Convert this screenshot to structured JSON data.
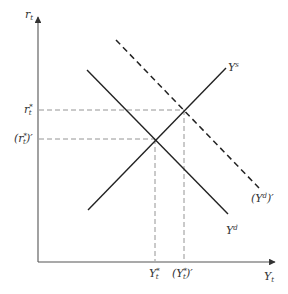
{
  "diagram": {
    "type": "supply-demand shift diagram",
    "axes": {
      "y_axis_label": {
        "base": "r",
        "sub": "t"
      },
      "x_axis_label": {
        "base": "Y",
        "sub": "t"
      },
      "origin": [
        38,
        262
      ],
      "y_axis_top": [
        38,
        17
      ],
      "x_axis_right": [
        275,
        262
      ]
    },
    "curves": [
      {
        "id": "Ys",
        "label": {
          "base": "Y",
          "sup": "s"
        },
        "style": "solid",
        "from": [
          88,
          210
        ],
        "to": [
          226,
          68
        ],
        "color": "#222222"
      },
      {
        "id": "Yd",
        "label": {
          "base": "Y",
          "sup": "d"
        },
        "style": "solid",
        "from": [
          87,
          70
        ],
        "to": [
          228,
          214
        ],
        "color": "#222222"
      },
      {
        "id": "Yd_prime",
        "label": {
          "open": "(",
          "base": "Y",
          "sup": "d",
          "close": ")′"
        },
        "style": "dashed",
        "from": [
          116,
          40
        ],
        "to": [
          259,
          188
        ],
        "color": "#222222"
      }
    ],
    "y_markers": [
      {
        "id": "r_star",
        "label": {
          "base": "r",
          "sub": "t",
          "sup": "*"
        },
        "y": 110,
        "x_end": 184
      },
      {
        "id": "r_star_prime",
        "label": {
          "open": "(",
          "base": "r",
          "sub": "t",
          "sup": "*",
          "close": ")′"
        },
        "y": 139,
        "x_end": 155
      }
    ],
    "x_markers": [
      {
        "id": "Y_star",
        "label": {
          "base": "Y",
          "sub": "t",
          "sup": "*"
        },
        "x": 155,
        "y_start": 139
      },
      {
        "id": "Y_star_prime",
        "label": {
          "open": "(",
          "base": "Y",
          "sub": "t",
          "sup": "*",
          "close": ")′"
        },
        "x": 184,
        "y_start": 110
      }
    ],
    "colors": {
      "line": "#222222",
      "axis": "#555555",
      "guide": "#888888",
      "label": "#333333"
    }
  }
}
